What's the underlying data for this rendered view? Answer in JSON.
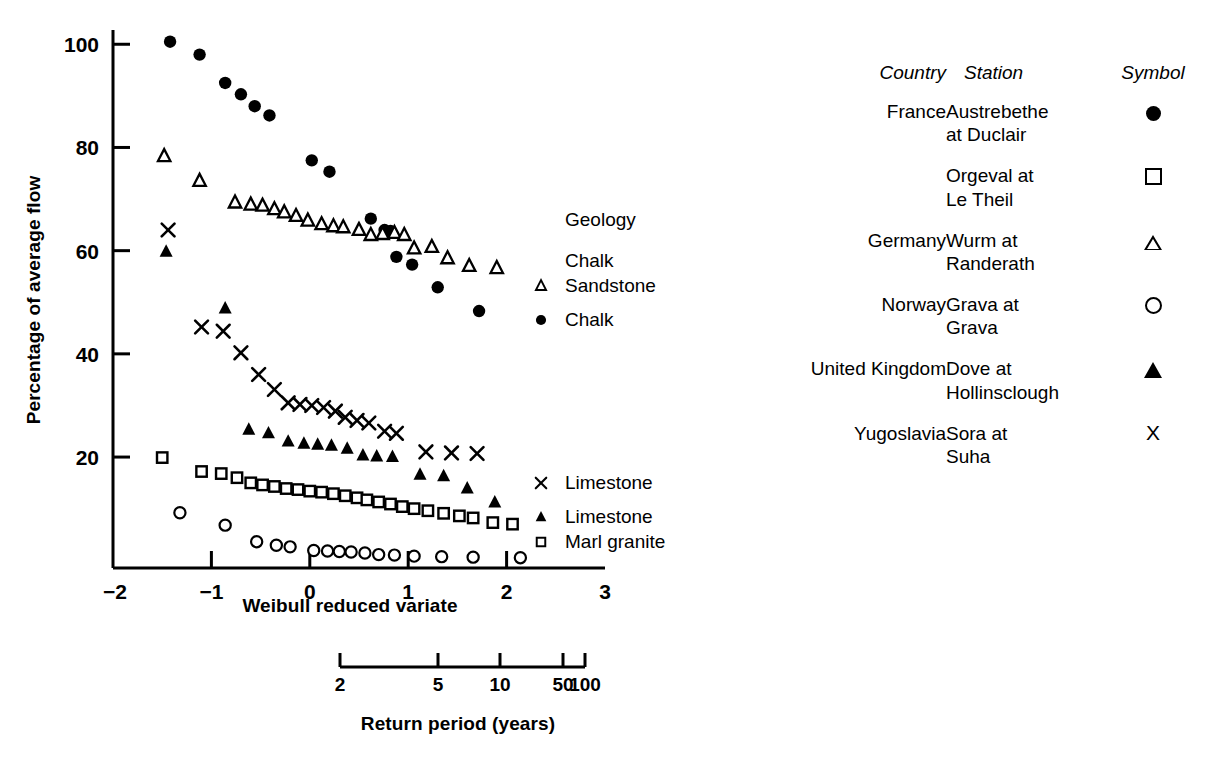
{
  "chart_data": {
    "type": "scatter",
    "title": "",
    "xlabel": "Weibull reduced variate",
    "ylabel": "Percentage of average flow",
    "xlim": [
      -2,
      3
    ],
    "ylim": [
      -1.5,
      106
    ],
    "xticks": [
      -2,
      -1,
      0,
      1,
      2,
      3
    ],
    "xtick_labels": [
      "−2",
      "−1",
      "0",
      "1",
      "2",
      "3"
    ],
    "yticks": [
      20,
      40,
      60,
      80,
      100
    ],
    "ytick_labels": [
      "20",
      "40",
      "60",
      "80",
      "100"
    ],
    "grid": false,
    "legend_position": "inside-right",
    "secondary_axis": {
      "label": "Return period (years)",
      "ticks": [
        2,
        5,
        10,
        50,
        100
      ],
      "tick_labels": [
        "2",
        "5",
        "10",
        "50",
        "100"
      ],
      "tick_x": [
        340,
        438,
        500,
        563,
        585
      ]
    },
    "inchart_annotations": [
      {
        "text": "Geology",
        "symbol": "none",
        "x": 565,
        "y": 226
      },
      {
        "text": "Chalk",
        "symbol": "none",
        "x": 565,
        "y": 267
      },
      {
        "text": "Sandstone",
        "symbol": "open-triangle",
        "x": 565,
        "y": 292
      },
      {
        "text": "Chalk",
        "symbol": "filled-circle",
        "x": 565,
        "y": 326
      },
      {
        "text": "Limestone",
        "symbol": "cross",
        "x": 565,
        "y": 489
      },
      {
        "text": "Limestone",
        "symbol": "filled-triangle",
        "x": 565,
        "y": 523
      },
      {
        "text": "Marl granite",
        "symbol": "open-square",
        "x": 565,
        "y": 548
      }
    ],
    "series": [
      {
        "name": "Austrebethe at Duclair",
        "country": "France",
        "geology": "Chalk",
        "symbol": "filled-circle",
        "points": [
          [
            -1.42,
            100.5
          ],
          [
            -1.12,
            98.0
          ],
          [
            -0.86,
            92.5
          ],
          [
            -0.7,
            90.3
          ],
          [
            -0.56,
            88.0
          ],
          [
            -0.41,
            86.2
          ],
          [
            0.02,
            77.5
          ],
          [
            0.2,
            75.3
          ],
          [
            0.62,
            66.2
          ],
          [
            0.76,
            64.0
          ],
          [
            0.82,
            63.8
          ],
          [
            0.88,
            58.8
          ],
          [
            1.04,
            57.3
          ],
          [
            1.3,
            52.9
          ],
          [
            1.72,
            48.3
          ]
        ]
      },
      {
        "name": "Orgeval at Le Theil",
        "country": "France",
        "geology": "Marl granite",
        "symbol": "open-square",
        "points": [
          [
            -1.5,
            19.9
          ],
          [
            -1.1,
            17.2
          ],
          [
            -0.9,
            16.8
          ],
          [
            -0.74,
            16.0
          ],
          [
            -0.6,
            15.0
          ],
          [
            -0.48,
            14.6
          ],
          [
            -0.36,
            14.3
          ],
          [
            -0.24,
            13.9
          ],
          [
            -0.12,
            13.7
          ],
          [
            0.0,
            13.4
          ],
          [
            0.12,
            13.2
          ],
          [
            0.24,
            12.9
          ],
          [
            0.36,
            12.5
          ],
          [
            0.48,
            12.1
          ],
          [
            0.58,
            11.7
          ],
          [
            0.7,
            11.3
          ],
          [
            0.82,
            10.9
          ],
          [
            0.94,
            10.4
          ],
          [
            1.06,
            10.0
          ],
          [
            1.2,
            9.6
          ],
          [
            1.36,
            9.1
          ],
          [
            1.52,
            8.6
          ],
          [
            1.66,
            8.2
          ],
          [
            1.86,
            7.3
          ],
          [
            2.06,
            7.0
          ]
        ]
      },
      {
        "name": "Wurm at Randerath",
        "country": "Germany",
        "geology": "Chalk Sandstone",
        "symbol": "open-triangle",
        "points": [
          [
            -1.48,
            78.3
          ],
          [
            -1.12,
            73.5
          ],
          [
            -0.76,
            69.3
          ],
          [
            -0.6,
            68.9
          ],
          [
            -0.48,
            68.7
          ],
          [
            -0.36,
            68.0
          ],
          [
            -0.26,
            67.4
          ],
          [
            -0.14,
            66.7
          ],
          [
            -0.02,
            65.8
          ],
          [
            0.12,
            65.1
          ],
          [
            0.24,
            64.7
          ],
          [
            0.34,
            64.5
          ],
          [
            0.5,
            64.0
          ],
          [
            0.62,
            63.0
          ],
          [
            0.74,
            63.2
          ],
          [
            0.86,
            63.4
          ],
          [
            0.96,
            63.0
          ],
          [
            1.06,
            60.4
          ],
          [
            1.24,
            60.7
          ],
          [
            1.4,
            58.5
          ],
          [
            1.62,
            57.0
          ],
          [
            1.9,
            56.6
          ]
        ]
      },
      {
        "name": "Grava at Grava",
        "country": "Norway",
        "geology": "",
        "symbol": "open-circle",
        "points": [
          [
            -1.32,
            9.2
          ],
          [
            -0.86,
            6.8
          ],
          [
            -0.54,
            3.6
          ],
          [
            -0.34,
            2.9
          ],
          [
            -0.2,
            2.6
          ],
          [
            0.04,
            1.9
          ],
          [
            0.18,
            1.8
          ],
          [
            0.3,
            1.7
          ],
          [
            0.42,
            1.6
          ],
          [
            0.56,
            1.4
          ],
          [
            0.7,
            1.1
          ],
          [
            0.86,
            1.0
          ],
          [
            1.06,
            0.8
          ],
          [
            1.34,
            0.7
          ],
          [
            1.66,
            0.6
          ],
          [
            2.14,
            0.5
          ]
        ]
      },
      {
        "name": "Dove at Hollinsclough",
        "country": "United Kingdom",
        "geology": "Limestone",
        "symbol": "filled-triangle",
        "points": [
          [
            -1.46,
            59.8
          ],
          [
            -0.86,
            48.8
          ],
          [
            -0.62,
            25.3
          ],
          [
            -0.42,
            24.6
          ],
          [
            -0.22,
            23.0
          ],
          [
            -0.06,
            22.6
          ],
          [
            0.08,
            22.4
          ],
          [
            0.22,
            22.2
          ],
          [
            0.38,
            21.6
          ],
          [
            0.54,
            20.3
          ],
          [
            0.68,
            20.1
          ],
          [
            0.84,
            20.0
          ],
          [
            1.12,
            16.6
          ],
          [
            1.36,
            16.3
          ],
          [
            1.6,
            13.9
          ],
          [
            1.88,
            11.2
          ]
        ]
      },
      {
        "name": "Sora at Suha",
        "country": "Yugoslavia",
        "geology": "Limestone",
        "symbol": "cross",
        "points": [
          [
            -1.44,
            64.0
          ],
          [
            -1.1,
            45.2
          ],
          [
            -0.88,
            44.4
          ],
          [
            -0.7,
            40.2
          ],
          [
            -0.52,
            36.0
          ],
          [
            -0.36,
            33.1
          ],
          [
            -0.22,
            30.5
          ],
          [
            -0.1,
            30.2
          ],
          [
            0.02,
            30.0
          ],
          [
            0.14,
            29.6
          ],
          [
            0.26,
            28.9
          ],
          [
            0.36,
            27.7
          ],
          [
            0.48,
            27.1
          ],
          [
            0.6,
            26.6
          ],
          [
            0.76,
            25.0
          ],
          [
            0.88,
            24.6
          ],
          [
            1.18,
            21.0
          ],
          [
            1.44,
            20.8
          ],
          [
            1.7,
            20.7
          ]
        ]
      }
    ]
  },
  "legend": {
    "headers": {
      "country": "Country",
      "station": "Station",
      "symbol": "Symbol"
    },
    "rows": [
      {
        "country": "France",
        "station_line1": "Austrebethe",
        "station_line2": "at Duclair",
        "symbol": "filled-circle"
      },
      {
        "country": "",
        "station_line1": "Orgeval at",
        "station_line2": "Le Theil",
        "symbol": "open-square"
      },
      {
        "country": "Germany",
        "station_line1": "Wurm at",
        "station_line2": "Randerath",
        "symbol": "open-triangle"
      },
      {
        "country": "Norway",
        "station_line1": "Grava at",
        "station_line2": "Grava",
        "symbol": "open-circle"
      },
      {
        "country": "United Kingdom",
        "station_line1": "Dove at",
        "station_line2": "Hollinsclough",
        "symbol": "filled-triangle"
      },
      {
        "country": "Yugoslavia",
        "station_line1": "Sora at",
        "station_line2": "Suha",
        "symbol": "cross"
      }
    ]
  },
  "colors": {
    "ink": "#000000",
    "paper": "#ffffff"
  }
}
